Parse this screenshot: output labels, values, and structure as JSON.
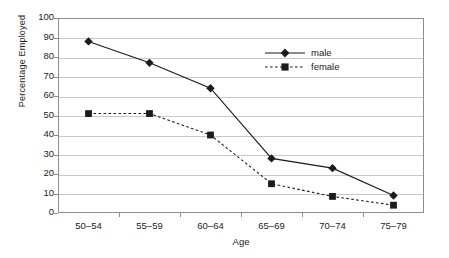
{
  "chart_data": {
    "type": "line",
    "title": "",
    "xlabel": "Age",
    "ylabel": "Percentage Employed",
    "categories": [
      "50–54",
      "55–59",
      "60–64",
      "65–69",
      "70–74",
      "75–79"
    ],
    "ylim": [
      0,
      100
    ],
    "ytick_labels": [
      "0",
      "10",
      "20",
      "30",
      "40",
      "50",
      "60",
      "70",
      "80",
      "90",
      "100"
    ],
    "ytick_values": [
      0,
      10,
      20,
      30,
      40,
      50,
      60,
      70,
      80,
      90,
      100
    ],
    "grid": "horizontal",
    "legend_position": "top-right-inside",
    "series": [
      {
        "name": "male",
        "values": [
          88,
          77,
          64,
          28,
          23,
          9
        ],
        "marker": "diamond",
        "linestyle": "solid",
        "color": "#1b1b1b"
      },
      {
        "name": "female",
        "values": [
          51,
          51,
          40,
          15,
          8.5,
          4
        ],
        "marker": "square",
        "linestyle": "dashed",
        "color": "#1b1b1b"
      }
    ]
  },
  "legend": {
    "entries": [
      {
        "label": "male"
      },
      {
        "label": "female"
      }
    ]
  },
  "colors": {
    "background": "#ffffff",
    "axis": "#8d8d8d",
    "grid": "#c8c8c8",
    "ink": "#1b1b1b"
  }
}
